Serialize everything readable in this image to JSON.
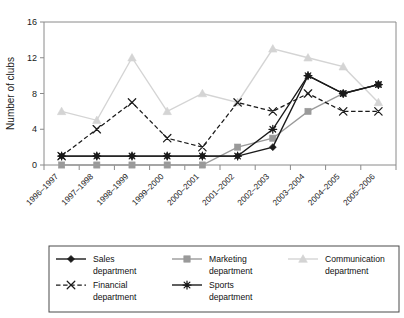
{
  "chart_data": {
    "type": "line",
    "title": "",
    "xlabel": "",
    "ylabel": "Number of clubs",
    "ylim": [
      0,
      16
    ],
    "yticks": [
      0,
      4,
      8,
      12,
      16
    ],
    "grid": false,
    "legend_position": "bottom",
    "categories": [
      "1996–1997",
      "1997–1998",
      "1998–1999",
      "1999–2000",
      "2000–2001",
      "2001–2002",
      "2002–2003",
      "2003–2004",
      "2004–2005",
      "2005–2006"
    ],
    "series": [
      {
        "name": "Sales department",
        "legend_line1": "Sales",
        "legend_line2": "department",
        "color": "#1a1a1a",
        "marker": "diamond",
        "dash": "solid",
        "values": [
          1,
          1,
          1,
          1,
          1,
          1,
          2,
          10,
          8,
          9
        ]
      },
      {
        "name": "Marketing department",
        "legend_line1": "Marketing",
        "legend_line2": "department",
        "color": "#9a9a9a",
        "marker": "square",
        "dash": "solid",
        "values": [
          0,
          0,
          0,
          0,
          0,
          2,
          3,
          6,
          8,
          9
        ]
      },
      {
        "name": "Communication department",
        "legend_line1": "Communication",
        "legend_line2": "department",
        "color": "#d4d4d4",
        "marker": "triangle",
        "dash": "solid",
        "values": [
          6,
          5,
          12,
          6,
          8,
          7,
          13,
          12,
          11,
          7
        ]
      },
      {
        "name": "Financial department",
        "legend_line1": "Financial",
        "legend_line2": "department",
        "color": "#1a1a1a",
        "marker": "cross",
        "dash": "dashed",
        "values": [
          1,
          4,
          7,
          3,
          2,
          7,
          6,
          8,
          6,
          6
        ]
      },
      {
        "name": "Sports department",
        "legend_line1": "Sports",
        "legend_line2": "department",
        "color": "#1a1a1a",
        "marker": "asterisk",
        "dash": "solid",
        "values": [
          1,
          1,
          1,
          1,
          1,
          1,
          4,
          10,
          8,
          9
        ]
      }
    ]
  }
}
